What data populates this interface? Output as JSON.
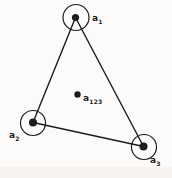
{
  "diagram": {
    "type": "graph",
    "ink_color": "#1d1c1b",
    "background_color": "#fcfbfa",
    "scan_band_color": "#f2efe8",
    "nodes": [
      {
        "id": "a1",
        "base": "a",
        "sub": "1",
        "position": "top"
      },
      {
        "id": "a2",
        "base": "a",
        "sub": "2",
        "position": "bottom-left"
      },
      {
        "id": "a3",
        "base": "a",
        "sub": "3",
        "position": "bottom-right"
      }
    ],
    "edges": [
      {
        "from": "a1",
        "to": "a2"
      },
      {
        "from": "a1",
        "to": "a3"
      },
      {
        "from": "a2",
        "to": "a3"
      }
    ],
    "interior_point": {
      "id": "a123",
      "base": "a",
      "sub": "123"
    }
  }
}
